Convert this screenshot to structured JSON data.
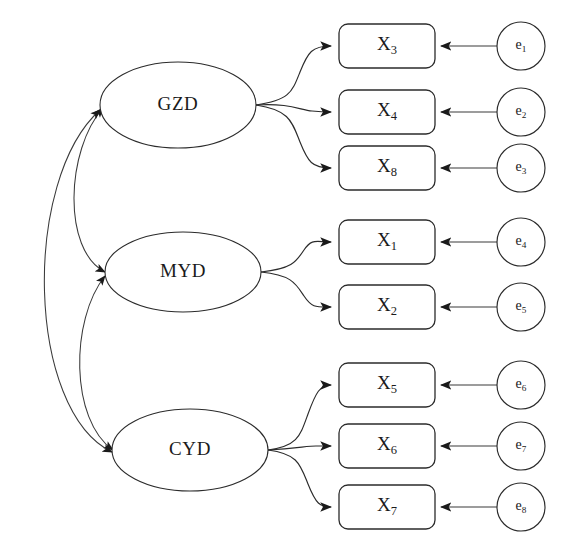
{
  "diagram": {
    "type": "sem-path-diagram",
    "title": "",
    "background_color": "#ffffff",
    "stroke_color": "#2b2b2b",
    "fill_color": "#ffffff"
  },
  "latent_variables": [
    {
      "id": "GZD",
      "label": "GZD",
      "cx": 178,
      "cy": 105,
      "rx": 78,
      "ry": 43
    },
    {
      "id": "MYD",
      "label": "MYD",
      "cx": 183,
      "cy": 272,
      "rx": 78,
      "ry": 40
    },
    {
      "id": "CYD",
      "label": "CYD",
      "cx": 190,
      "cy": 450,
      "rx": 78,
      "ry": 41
    }
  ],
  "indicators": [
    {
      "id": "X3",
      "base": "X",
      "sub": "3",
      "x": 339,
      "y": 24,
      "w": 96,
      "h": 44,
      "parent": "GZD"
    },
    {
      "id": "X4",
      "base": "X",
      "sub": "4",
      "x": 339,
      "y": 90,
      "w": 96,
      "h": 44,
      "parent": "GZD"
    },
    {
      "id": "X8",
      "base": "X",
      "sub": "8",
      "x": 339,
      "y": 146,
      "w": 96,
      "h": 44,
      "parent": "GZD"
    },
    {
      "id": "X1",
      "base": "X",
      "sub": "1",
      "x": 339,
      "y": 220,
      "w": 96,
      "h": 44,
      "parent": "MYD"
    },
    {
      "id": "X2",
      "base": "X",
      "sub": "2",
      "x": 339,
      "y": 285,
      "w": 96,
      "h": 44,
      "parent": "MYD"
    },
    {
      "id": "X5",
      "base": "X",
      "sub": "5",
      "x": 339,
      "y": 363,
      "w": 96,
      "h": 44,
      "parent": "CYD"
    },
    {
      "id": "X6",
      "base": "X",
      "sub": "6",
      "x": 339,
      "y": 424,
      "w": 96,
      "h": 44,
      "parent": "CYD"
    },
    {
      "id": "X7",
      "base": "X",
      "sub": "7",
      "x": 339,
      "y": 485,
      "w": 96,
      "h": 44,
      "parent": "CYD"
    }
  ],
  "errors": [
    {
      "id": "e1",
      "base": "e",
      "sub": "1",
      "cx": 521,
      "cy": 46,
      "r": 24,
      "target": "X3"
    },
    {
      "id": "e2",
      "base": "e",
      "sub": "2",
      "cx": 521,
      "cy": 112,
      "r": 24,
      "target": "X4"
    },
    {
      "id": "e3",
      "base": "e",
      "sub": "3",
      "cx": 521,
      "cy": 168,
      "r": 24,
      "target": "X8"
    },
    {
      "id": "e4",
      "base": "e",
      "sub": "4",
      "cx": 521,
      "cy": 242,
      "r": 24,
      "target": "X1"
    },
    {
      "id": "e5",
      "base": "e",
      "sub": "5",
      "cx": 521,
      "cy": 307,
      "r": 24,
      "target": "X2"
    },
    {
      "id": "e6",
      "base": "e",
      "sub": "6",
      "cx": 521,
      "cy": 385,
      "r": 24,
      "target": "X5"
    },
    {
      "id": "e7",
      "base": "e",
      "sub": "7",
      "cx": 521,
      "cy": 446,
      "r": 24,
      "target": "X6"
    },
    {
      "id": "e8",
      "base": "e",
      "sub": "8",
      "cx": 521,
      "cy": 507,
      "r": 24,
      "target": "X7"
    }
  ],
  "loading_paths": [
    {
      "from": "GZD",
      "to": "X3",
      "d": "M 256 105 C 290 100 292 92 300 72 C 308 52 312 46 331 46"
    },
    {
      "from": "GZD",
      "to": "X4",
      "d": "M 256 105 C 290 103 300 110 312 111 C 322 112 326 112 331 112"
    },
    {
      "from": "GZD",
      "to": "X8",
      "d": "M 256 105 C 290 110 292 122 300 142 C 308 162 312 168 331 168"
    },
    {
      "from": "MYD",
      "to": "X1",
      "d": "M 261 272 C 292 269 296 262 304 250 C 312 238 316 242 331 242"
    },
    {
      "from": "MYD",
      "to": "X2",
      "d": "M 261 272 C 292 275 296 284 304 296 C 312 308 316 307 331 307"
    },
    {
      "from": "CYD",
      "to": "X5",
      "d": "M 268 450 C 298 446 300 436 308 414 C 316 392 320 385 331 385"
    },
    {
      "from": "CYD",
      "to": "X6",
      "d": "M 268 450 C 298 448 308 446 316 446 C 324 446 327 446 331 446"
    },
    {
      "from": "CYD",
      "to": "X7",
      "d": "M 268 450 C 298 454 300 464 308 484 C 316 504 320 507 331 507"
    }
  ],
  "correlation_paths": [
    {
      "between": [
        "GZD",
        "MYD"
      ],
      "d": "M 105 272 C 62 250 66 150 103 108"
    },
    {
      "between": [
        "MYD",
        "CYD"
      ],
      "d": "M 113 450 C 70 420 70 320 105 276"
    },
    {
      "between": [
        "GZD",
        "CYD"
      ],
      "d": "M 112 452 C 26 410 22 180 100 110"
    }
  ],
  "error_paths": [
    {
      "from": "e1",
      "to": "X3",
      "d": "M 497 46 L 441 46"
    },
    {
      "from": "e2",
      "to": "X4",
      "d": "M 497 112 L 441 112"
    },
    {
      "from": "e3",
      "to": "X8",
      "d": "M 497 168 L 441 168"
    },
    {
      "from": "e4",
      "to": "X1",
      "d": "M 497 242 L 441 242"
    },
    {
      "from": "e5",
      "to": "X2",
      "d": "M 497 307 L 441 307"
    },
    {
      "from": "e6",
      "to": "X5",
      "d": "M 497 385 L 441 385"
    },
    {
      "from": "e7",
      "to": "X6",
      "d": "M 497 446 L 441 446"
    },
    {
      "from": "e8",
      "to": "X7",
      "d": "M 497 507 L 441 507"
    }
  ]
}
